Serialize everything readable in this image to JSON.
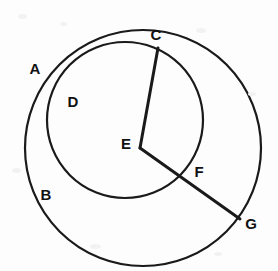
{
  "figure": {
    "canvas": {
      "width": 278,
      "height": 271,
      "background": "#fdfdfd"
    },
    "stroke_color": "#1a1a1a",
    "label_color": "#111111",
    "circles": [
      {
        "name": "outer-circle",
        "description": "Large circle centered at E",
        "cx": 143,
        "cy": 148,
        "r": 118,
        "stroke_width": 2.2
      },
      {
        "name": "inner-circle",
        "description": "Smaller circle through A, D, B and C",
        "cx": 125,
        "cy": 120,
        "r": 78,
        "stroke_width": 2.2
      }
    ],
    "segments": [
      {
        "name": "segment-EC",
        "from": "E",
        "to": "C",
        "x1": 140,
        "y1": 148,
        "x2": 158,
        "y2": 48,
        "stroke_width": 3
      },
      {
        "name": "segment-EG",
        "from": "E",
        "to": "G",
        "x1": 140,
        "y1": 148,
        "x2": 240,
        "y2": 219,
        "stroke_width": 3
      }
    ],
    "points": [
      {
        "name": "point-a",
        "label": "A",
        "x": 29,
        "y": 110,
        "label_x": 35,
        "label_y": 68,
        "on": "inner-circle"
      },
      {
        "name": "point-c",
        "label": "C",
        "x": 158,
        "y": 48,
        "label_x": 156,
        "label_y": 34,
        "on": "circle-intersection"
      },
      {
        "name": "point-d",
        "label": "D",
        "x": 60,
        "y": 96,
        "label_x": 73,
        "label_y": 101,
        "on": "inner-circle"
      },
      {
        "name": "point-e",
        "label": "E",
        "x": 140,
        "y": 148,
        "label_x": 126,
        "label_y": 143,
        "on": "outer-circle-center"
      },
      {
        "name": "point-b",
        "label": "B",
        "x": 57,
        "y": 191,
        "label_x": 46,
        "label_y": 194,
        "on": "circle-intersection"
      },
      {
        "name": "point-f",
        "label": "F",
        "x": 186,
        "y": 174,
        "label_x": 199,
        "label_y": 171,
        "on": "inner-circle"
      },
      {
        "name": "point-g",
        "label": "G",
        "x": 240,
        "y": 219,
        "label_x": 251,
        "label_y": 223,
        "on": "outer-circle"
      }
    ]
  }
}
